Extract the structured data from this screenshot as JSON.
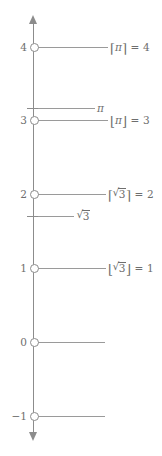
{
  "figure": {
    "axis": {
      "orientation": "vertical",
      "arrow_top": "arrow-up-icon",
      "arrow_bottom": "arrow-down-icon",
      "line_color": "#8c8c8c",
      "tick_labels": [
        "4",
        "3",
        "2",
        "1",
        "0",
        "−1"
      ]
    },
    "ticks": [
      {
        "label": "4",
        "y": 47,
        "type": "integer"
      },
      {
        "label": "3",
        "y": 120,
        "type": "integer"
      },
      {
        "label": "2",
        "y": 194,
        "type": "integer"
      },
      {
        "label": "1",
        "y": 268,
        "type": "integer"
      },
      {
        "label": "0",
        "y": 342,
        "type": "integer"
      },
      {
        "label": "−1",
        "y": 416,
        "type": "integer"
      }
    ],
    "irrational_marks": [
      {
        "name": "pi",
        "label": "π",
        "y": 108,
        "value": 3.14159
      },
      {
        "name": "sqrt3",
        "label": "√3",
        "y": 216,
        "value": 1.73205
      }
    ],
    "annotations": [
      {
        "name": "ceil-pi",
        "text": "⌈π⌉ = 4",
        "left": 110,
        "y": 47
      },
      {
        "name": "pi-mark",
        "text": "π",
        "left": 98,
        "y": 108
      },
      {
        "name": "floor-pi",
        "text": "⌊π⌋ = 3",
        "left": 110,
        "y": 120
      },
      {
        "name": "ceil-sqrt3",
        "text": "⌈√3⌉ = 2",
        "left": 110,
        "y": 194
      },
      {
        "name": "sqrt3-mark",
        "text": "√3",
        "left": 78,
        "y": 216
      },
      {
        "name": "floor-sqrt3",
        "text": "⌊√3⌋ = 1",
        "left": 110,
        "y": 268
      }
    ],
    "math": {
      "pi_symbol": "π",
      "equals": "=",
      "radicand_3": "3",
      "ceil_pi_value": "4",
      "floor_pi_value": "3",
      "ceil_sqrt3_value": "2",
      "floor_sqrt3_value": "1",
      "ceil_left": "⌈",
      "ceil_right": "⌉",
      "floor_left": "⌊",
      "floor_right": "⌋"
    },
    "colors": {
      "line": "#8c8c8c",
      "rule": "#9a9a9a",
      "text": "#6e6e6e",
      "background": "#ffffff"
    }
  }
}
